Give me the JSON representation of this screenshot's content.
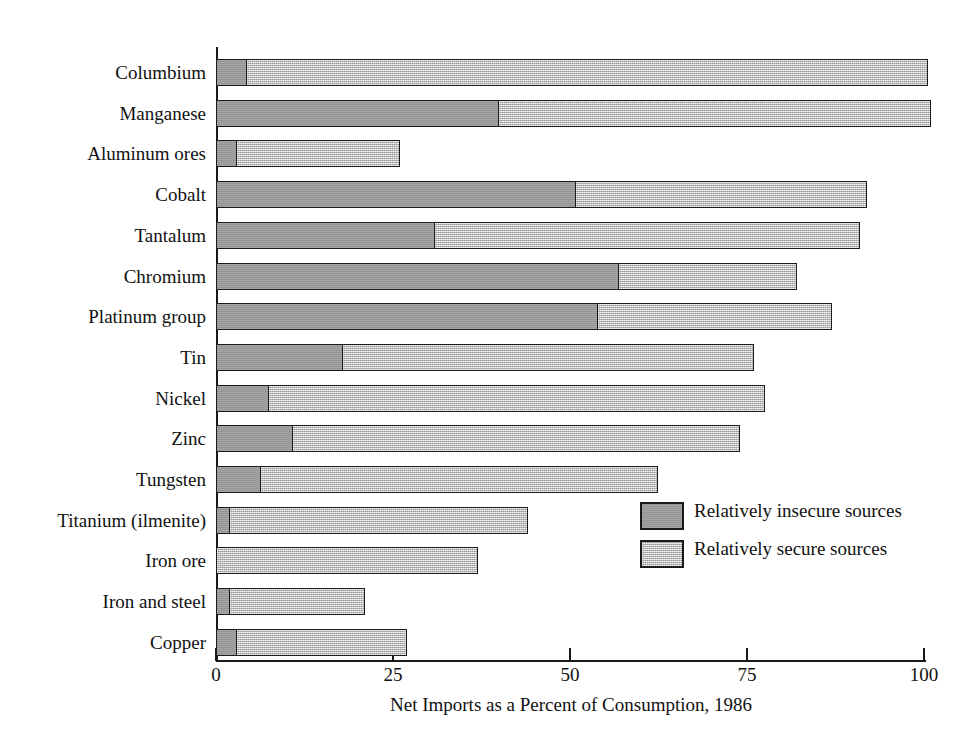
{
  "chart_data": {
    "type": "bar",
    "orientation": "horizontal",
    "stacked": true,
    "title": "",
    "xlabel": "Net Imports as a Percent of Consumption, 1986",
    "ylabel": "",
    "xlim": [
      0,
      100
    ],
    "grid": false,
    "tick_labels": [
      "0",
      "25",
      "50",
      "75",
      "100"
    ],
    "tick_values": [
      0,
      25,
      50,
      75,
      100
    ],
    "legend_position": "inside-lower-right",
    "categories": [
      "Columbium",
      "Manganese",
      "Aluminum ores",
      "Cobalt",
      "Tantalum",
      "Chromium",
      "Platinum group",
      "Tin",
      "Nickel",
      "Zinc",
      "Tungsten",
      "Titanium (ilmenite)",
      "Iron ore",
      "Iron and steel",
      "Copper"
    ],
    "series": [
      {
        "name": "Relatively insecure sources",
        "color": "#9a9a9a",
        "values": [
          4.5,
          40,
          3,
          51,
          31,
          57,
          54,
          18,
          7.5,
          11,
          6.5,
          2,
          0,
          2,
          3
        ]
      },
      {
        "name": "Relatively secure sources",
        "color": "#c6c6c6",
        "values": [
          96,
          61,
          23,
          41,
          60,
          25,
          33,
          58,
          70,
          63,
          56,
          42,
          37,
          19,
          24
        ]
      }
    ],
    "totals": [
      100.5,
      101,
      26,
      92,
      91,
      82,
      87,
      76,
      77.5,
      74,
      62.5,
      44,
      37,
      21,
      27
    ]
  },
  "legend": {
    "items": [
      {
        "label": "Relatively insecure sources",
        "color": "#9a9a9a"
      },
      {
        "label": "Relatively secure sources",
        "color": "#c6c6c6"
      }
    ]
  }
}
